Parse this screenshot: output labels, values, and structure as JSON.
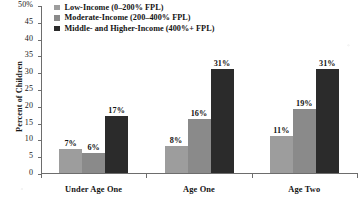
{
  "chart_data": {
    "type": "bar",
    "title": "",
    "subtitle": "",
    "xlabel": "",
    "ylabel": "Percent of Children",
    "ylim": [
      0,
      50
    ],
    "ytick_step": 5,
    "ytick_labels": [
      "50%",
      "45",
      "40",
      "35",
      "30",
      "25",
      "20",
      "15",
      "10",
      "5",
      "0"
    ],
    "grid": false,
    "legend_position": "top-left",
    "categories": [
      "Under Age One",
      "Age One",
      "Age Two"
    ],
    "series": [
      {
        "name": "Low-Income (0–200% FPL)",
        "color": "#9d9d9d",
        "values": [
          7,
          8,
          11
        ],
        "labels": [
          "7%",
          "8%",
          "11%"
        ]
      },
      {
        "name": "Moderate-Income (200–400% FPL)",
        "color": "#8a8a8a",
        "values": [
          6,
          16,
          19
        ],
        "labels": [
          "6%",
          "16%",
          "19%"
        ]
      },
      {
        "name": "Middle- and Higher-Income (400%+ FPL)",
        "color": "#2b2b2b",
        "values": [
          17,
          31,
          31
        ],
        "labels": [
          "17%",
          "31%",
          "31%"
        ]
      }
    ]
  }
}
